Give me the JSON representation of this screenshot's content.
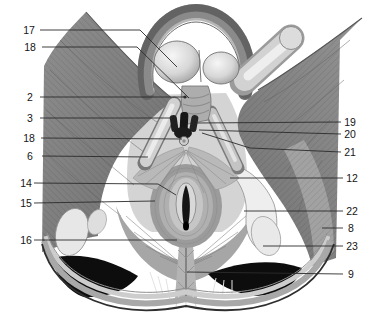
{
  "figure": {
    "kind": "anatomical-plate",
    "background": "#ffffff",
    "leader_color": "#2b2b2b",
    "label_color": "#151515",
    "label_font_px": 10.5
  },
  "palette": {
    "muscle_dark": "#6d6d6d",
    "muscle_mid": "#9a9a9a",
    "muscle_light": "#c8c8c8",
    "bone_white": "#ececec",
    "cavity_black": "#0d0d0d",
    "vessel_black": "#161616"
  },
  "labels": [
    {
      "n": "17",
      "x": 29,
      "y": 30,
      "line": [
        [
          40,
          30
        ],
        [
          140,
          30
        ],
        [
          177,
          67
        ]
      ]
    },
    {
      "n": "18",
      "x": 30,
      "y": 47,
      "line": [
        [
          42,
          47
        ],
        [
          137,
          47
        ],
        [
          189,
          98
        ]
      ]
    },
    {
      "n": "2",
      "x": 30,
      "y": 97,
      "line": [
        [
          40,
          97
        ],
        [
          184,
          97
        ]
      ],
      "dot": [
        185,
        97
      ]
    },
    {
      "n": "3",
      "x": 30,
      "y": 118,
      "line": [
        [
          40,
          118
        ],
        [
          172,
          118
        ]
      ]
    },
    {
      "n": "18",
      "x": 29,
      "y": 138,
      "line": [
        [
          41,
          138
        ],
        [
          182,
          139
        ]
      ]
    },
    {
      "n": "6",
      "x": 30,
      "y": 156,
      "line": [
        [
          42,
          156
        ],
        [
          148,
          157
        ]
      ]
    },
    {
      "n": "14",
      "x": 26,
      "y": 183,
      "line": [
        [
          34,
          183
        ],
        [
          158,
          184
        ],
        [
          176,
          195
        ]
      ]
    },
    {
      "n": "15",
      "x": 26,
      "y": 203,
      "line": [
        [
          34,
          203
        ],
        [
          155,
          201
        ]
      ]
    },
    {
      "n": "16",
      "x": 26,
      "y": 240,
      "line": [
        [
          34,
          240
        ],
        [
          177,
          240
        ]
      ]
    },
    {
      "n": "19",
      "x": 350,
      "y": 122,
      "line": [
        [
          341,
          122
        ],
        [
          196,
          123
        ]
      ]
    },
    {
      "n": "20",
      "x": 350,
      "y": 134,
      "line": [
        [
          341,
          134
        ],
        [
          199,
          130
        ]
      ]
    },
    {
      "n": "21",
      "x": 350,
      "y": 152,
      "line": [
        [
          341,
          152
        ],
        [
          250,
          148
        ],
        [
          202,
          133
        ]
      ]
    },
    {
      "n": "12",
      "x": 352,
      "y": 178,
      "line": [
        [
          343,
          178
        ],
        [
          230,
          178
        ]
      ]
    },
    {
      "n": "22",
      "x": 352,
      "y": 211,
      "line": [
        [
          343,
          211
        ],
        [
          244,
          211
        ]
      ]
    },
    {
      "n": "8",
      "x": 351,
      "y": 228,
      "line": [
        [
          343,
          228
        ],
        [
          322,
          228
        ]
      ]
    },
    {
      "n": "23",
      "x": 352,
      "y": 246,
      "line": [
        [
          343,
          246
        ],
        [
          263,
          246
        ]
      ]
    },
    {
      "n": "9",
      "x": 351,
      "y": 274,
      "line": [
        [
          343,
          274
        ],
        [
          187,
          272
        ]
      ]
    }
  ]
}
